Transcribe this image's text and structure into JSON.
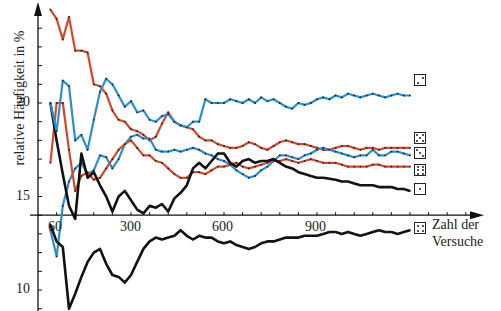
{
  "chart_data": {
    "type": "line",
    "title": "",
    "xlabel": "Zahl der Versuche",
    "ylabel": "relative Häufigkeit in %",
    "x_ticks": [
      60,
      300,
      600,
      900
    ],
    "y_ticks": [
      10,
      15,
      20
    ],
    "xlim": [
      0,
      1250
    ],
    "ylim": [
      9,
      25
    ],
    "x_axis_crosses_y_at": 14,
    "grid": false,
    "legend": "dice faces drawn at the right end of each series",
    "x": [
      40,
      60,
      80,
      100,
      120,
      140,
      160,
      180,
      200,
      220,
      240,
      260,
      280,
      300,
      320,
      340,
      360,
      380,
      400,
      420,
      440,
      460,
      480,
      500,
      520,
      540,
      560,
      580,
      600,
      620,
      640,
      660,
      680,
      700,
      720,
      740,
      760,
      780,
      800,
      820,
      840,
      860,
      880,
      900,
      920,
      940,
      960,
      980,
      1000,
      1020,
      1040,
      1060,
      1080,
      1100,
      1120,
      1140,
      1160,
      1180,
      1200
    ],
    "series": [
      {
        "name": "Augenzahl 1",
        "face": 1,
        "color": "#111111",
        "values": [
          20.0,
          18.0,
          16.2,
          14.5,
          13.8,
          17.3,
          16.0,
          16.3,
          15.6,
          15.0,
          14.2,
          15.0,
          15.3,
          14.8,
          14.3,
          14.1,
          14.5,
          14.4,
          14.6,
          14.2,
          14.9,
          15.2,
          15.6,
          16.5,
          16.8,
          16.5,
          16.9,
          17.3,
          17.3,
          16.8,
          16.6,
          16.9,
          17.0,
          16.8,
          16.9,
          16.9,
          17.0,
          16.8,
          16.6,
          16.5,
          16.3,
          16.2,
          16.1,
          16.0,
          16.0,
          15.95,
          15.9,
          15.8,
          15.8,
          15.7,
          15.6,
          15.6,
          15.6,
          15.5,
          15.5,
          15.5,
          15.4,
          15.4,
          15.3
        ]
      },
      {
        "name": "Augenzahl 2",
        "face": 2,
        "color": "#2a8fd0",
        "values": [
          20.0,
          18.5,
          21.2,
          20.9,
          18.0,
          18.3,
          17.5,
          19.1,
          20.6,
          21.3,
          21.0,
          20.4,
          19.8,
          20.1,
          19.5,
          19.6,
          19.1,
          19.0,
          19.3,
          19.4,
          19.0,
          18.8,
          18.7,
          19.0,
          19.0,
          20.2,
          20.0,
          20.0,
          20.0,
          20.2,
          20.1,
          20.0,
          20.2,
          20.0,
          20.3,
          20.1,
          20.2,
          20.0,
          19.8,
          19.7,
          20.0,
          19.9,
          20.0,
          20.2,
          20.3,
          20.2,
          20.4,
          20.3,
          20.5,
          20.4,
          20.3,
          20.4,
          20.5,
          20.4,
          20.3,
          20.4,
          20.5,
          20.4,
          20.4
        ]
      },
      {
        "name": "Augenzahl 3",
        "face": 3,
        "color": "#2a8fd0",
        "values": [
          13.2,
          11.8,
          14.5,
          15.8,
          16.5,
          16.8,
          16.2,
          16.4,
          17.2,
          17.1,
          16.5,
          17.0,
          17.8,
          18.2,
          18.3,
          18.1,
          18.1,
          17.5,
          17.4,
          17.4,
          17.5,
          17.4,
          17.5,
          17.6,
          17.5,
          17.3,
          17.2,
          17.0,
          16.9,
          16.7,
          16.4,
          16.2,
          16.0,
          16.1,
          16.4,
          16.6,
          16.9,
          17.2,
          17.2,
          17.1,
          17.0,
          17.2,
          17.3,
          17.5,
          17.6,
          17.5,
          17.4,
          17.3,
          17.2,
          17.1,
          17.2,
          17.2,
          17.5,
          17.2,
          17.2,
          17.4,
          17.4,
          17.3,
          17.2
        ]
      },
      {
        "name": "Augenzahl 4",
        "face": 4,
        "color": "#111111",
        "values": [
          13.5,
          12.6,
          12.3,
          9.0,
          9.8,
          10.7,
          11.5,
          12.0,
          12.2,
          11.4,
          10.8,
          10.7,
          10.4,
          10.8,
          11.5,
          12.2,
          12.6,
          12.8,
          12.7,
          12.8,
          12.9,
          13.2,
          12.9,
          12.7,
          12.9,
          12.8,
          12.8,
          12.6,
          12.5,
          12.6,
          12.4,
          12.3,
          12.2,
          12.3,
          12.5,
          12.6,
          12.6,
          12.7,
          12.8,
          12.8,
          12.8,
          12.9,
          12.9,
          12.9,
          13.0,
          13.1,
          13.1,
          13.0,
          13.1,
          13.0,
          12.9,
          13.0,
          13.1,
          13.2,
          13.1,
          13.1,
          13.0,
          13.1,
          13.2
        ]
      },
      {
        "name": "Augenzahl 5",
        "face": 5,
        "color": "#d9472b",
        "values": [
          25.0,
          24.5,
          23.4,
          24.6,
          22.8,
          22.8,
          22.7,
          21.0,
          20.9,
          20.5,
          19.6,
          19.1,
          19.0,
          18.6,
          18.5,
          18.3,
          18.0,
          18.2,
          18.9,
          19.5,
          19.0,
          18.8,
          18.7,
          18.6,
          18.2,
          18.0,
          18.0,
          17.8,
          17.7,
          17.6,
          17.6,
          17.7,
          17.9,
          17.8,
          17.6,
          17.5,
          17.7,
          17.9,
          18.0,
          17.9,
          17.8,
          17.8,
          17.7,
          17.6,
          17.5,
          17.5,
          17.6,
          17.7,
          17.7,
          17.6,
          17.5,
          17.6,
          17.6,
          17.5,
          17.6,
          17.6,
          17.6,
          17.6,
          17.6
        ]
      },
      {
        "name": "Augenzahl 6",
        "face": 6,
        "color": "#d9472b",
        "values": [
          16.8,
          20.0,
          20.0,
          17.5,
          15.3,
          16.1,
          16.3,
          15.9,
          16.0,
          16.5,
          17.0,
          17.5,
          17.8,
          18.0,
          17.6,
          17.2,
          17.2,
          16.9,
          16.8,
          16.5,
          16.2,
          16.0,
          16.0,
          16.3,
          16.3,
          16.2,
          16.4,
          16.6,
          16.6,
          16.7,
          16.8,
          16.6,
          16.5,
          16.6,
          16.7,
          16.8,
          16.9,
          16.9,
          17.0,
          16.9,
          16.8,
          16.9,
          17.0,
          16.9,
          16.8,
          16.8,
          16.8,
          16.7,
          16.6,
          16.6,
          16.6,
          16.6,
          16.7,
          16.7,
          16.6,
          16.6,
          16.6,
          16.6,
          16.6
        ]
      }
    ]
  },
  "axis": {
    "ylabel": "relative Häufigkeit in %",
    "xlabel_line1": "Zahl der",
    "xlabel_line2": "Versuche",
    "y_tick_labels": [
      "20",
      "15",
      "10"
    ],
    "x_tick_labels": [
      "60",
      "300",
      "600",
      "900"
    ]
  }
}
